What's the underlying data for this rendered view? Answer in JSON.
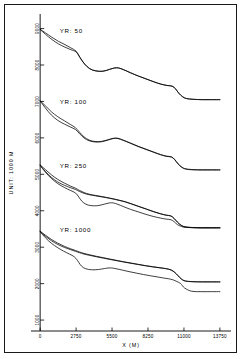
{
  "figure": {
    "background_color": "#ffffff",
    "frame_color": "#1a1a1a",
    "line_color": "#000000"
  },
  "chart_data": {
    "type": "line",
    "title": "",
    "subtitle": "",
    "xlabel": "X (M)",
    "ylabel": "UNIT: 1000 M",
    "xlim": [
      -700,
      14600
    ],
    "ylim": [
      700,
      9400
    ],
    "grid": false,
    "legend_position": "inline-annotation",
    "x_ticks": [
      0,
      2750,
      5500,
      8250,
      11000,
      13750
    ],
    "x_tick_labels": [
      "0",
      "2750",
      "5500",
      "8250",
      "11000",
      "13750"
    ],
    "y_ticks": [
      1000,
      2000,
      3000,
      4000,
      5000,
      6000,
      7000,
      8000,
      9000
    ],
    "y_tick_labels": [
      "1000",
      "2000",
      "3000",
      "4000",
      "5000",
      "6000",
      "7000",
      "8000",
      "9000"
    ],
    "annotations": [
      {
        "text": "YR:    50",
        "x": 1500,
        "y": 8870
      },
      {
        "text": "YR:   100",
        "x": 1500,
        "y": 6930
      },
      {
        "text": "YR:   250",
        "x": 1500,
        "y": 5180
      },
      {
        "text": "YR:  1000",
        "x": 1500,
        "y": 3420
      }
    ],
    "panels": [
      {
        "name": "YR: 50",
        "label": "YR:    50",
        "year": 50,
        "series": [
          {
            "name": "yr50-profile-a",
            "x": [
              0,
              420,
              900,
              1400,
              1900,
              2350,
              2750,
              3050,
              3400,
              3800,
              4250,
              4800,
              5300,
              5700,
              6000,
              6400,
              6900,
              7500,
              8100,
              8700,
              9200,
              9700,
              10100,
              10350,
              10600,
              10900,
              11200,
              11700,
              12400,
              13100,
              13750
            ],
            "y": [
              8980,
              8880,
              8760,
              8650,
              8560,
              8470,
              8380,
              8210,
              8030,
              7900,
              7840,
              7830,
              7880,
              7920,
              7920,
              7870,
              7790,
              7700,
              7620,
              7540,
              7480,
              7440,
              7420,
              7350,
              7230,
              7130,
              7080,
              7060,
              7050,
              7050,
              7050
            ]
          },
          {
            "name": "yr50-profile-b",
            "x": [
              0,
              420,
              900,
              1400,
              1900,
              2350,
              2750,
              3050,
              3400,
              3800,
              4250,
              4800,
              5300,
              5700,
              6000,
              6400,
              6900,
              7500,
              8100,
              8700,
              9200,
              9700,
              10100,
              10350,
              10600,
              10900,
              11200,
              11700,
              12400,
              13100,
              13750
            ],
            "y": [
              8975,
              8840,
              8700,
              8580,
              8490,
              8420,
              8360,
              8200,
              8025,
              7895,
              7838,
              7828,
              7878,
              7918,
              7918,
              7868,
              7788,
              7698,
              7618,
              7538,
              7478,
              7438,
              7418,
              7348,
              7228,
              7128,
              7078,
              7058,
              7048,
              7048,
              7048
            ]
          }
        ]
      },
      {
        "name": "YR: 100",
        "label": "YR:   100",
        "year": 100,
        "series": [
          {
            "name": "yr100-profile-a",
            "x": [
              0,
              400,
              850,
              1350,
              1850,
              2300,
              2700,
              3000,
              3350,
              3750,
              4200,
              4700,
              5200,
              5600,
              5950,
              6350,
              6900,
              7500,
              8100,
              8700,
              9200,
              9650,
              10050,
              10300,
              10550,
              10850,
              11150,
              11700,
              12400,
              13100,
              13750
            ],
            "y": [
              7020,
              6880,
              6720,
              6580,
              6470,
              6370,
              6280,
              6160,
              6030,
              5940,
              5900,
              5905,
              5950,
              5990,
              5990,
              5940,
              5860,
              5770,
              5690,
              5610,
              5545,
              5500,
              5480,
              5405,
              5290,
              5195,
              5150,
              5130,
              5125,
              5125,
              5125
            ]
          },
          {
            "name": "yr100-profile-b",
            "x": [
              0,
              400,
              850,
              1350,
              1850,
              2300,
              2700,
              3000,
              3350,
              3750,
              4200,
              4700,
              5200,
              5600,
              5950,
              6350,
              6900,
              7500,
              8100,
              8700,
              9200,
              9650,
              10050,
              10300,
              10550,
              10850,
              11150,
              11700,
              12400,
              13100,
              13750
            ],
            "y": [
              7015,
              6820,
              6630,
              6480,
              6380,
              6300,
              6230,
              6120,
              6000,
              5920,
              5888,
              5893,
              5942,
              5982,
              5982,
              5932,
              5852,
              5762,
              5682,
              5602,
              5538,
              5493,
              5473,
              5398,
              5283,
              5188,
              5143,
              5123,
              5118,
              5118,
              5118
            ]
          }
        ]
      },
      {
        "name": "YR: 250",
        "label": "YR:   250",
        "year": 250,
        "series": [
          {
            "name": "yr250-profile-a",
            "x": [
              0,
              400,
              850,
              1350,
              1850,
              2300,
              2700,
              3000,
              3350,
              3750,
              4250,
              4800,
              5300,
              5700,
              6050,
              6500,
              7000,
              7550,
              8150,
              8700,
              9200,
              9650,
              10000,
              10250,
              10500,
              10800,
              11100,
              11700,
              12400,
              13100,
              13750
            ],
            "y": [
              5260,
              5130,
              4990,
              4860,
              4760,
              4680,
              4620,
              4560,
              4500,
              4455,
              4420,
              4385,
              4350,
              4320,
              4290,
              4250,
              4190,
              4120,
              4045,
              3975,
              3920,
              3880,
              3860,
              3790,
              3690,
              3600,
              3560,
              3540,
              3535,
              3535,
              3535
            ]
          },
          {
            "name": "yr250-profile-b",
            "x": [
              0,
              400,
              850,
              1350,
              1850,
              2300,
              2700,
              3000,
              3350,
              3750,
              4250,
              4800,
              5300,
              5700,
              6050,
              6500,
              7000,
              7550,
              8150,
              8700,
              9200,
              9650,
              10000,
              10250,
              10500,
              10800,
              11100,
              11700,
              12400,
              13100,
              13750
            ],
            "y": [
              5250,
              5080,
              4920,
              4790,
              4700,
              4635,
              4585,
              4530,
              4478,
              4440,
              4408,
              4375,
              4342,
              4312,
              4283,
              4243,
              4184,
              4114,
              4040,
              3970,
              3916,
              3876,
              3856,
              3786,
              3686,
              3596,
              3556,
              3536,
              3531,
              3531,
              3531
            ]
          },
          {
            "name": "yr250-profile-c",
            "x": [
              0,
              400,
              850,
              1350,
              1850,
              2300,
              2700,
              2950,
              3200,
              3500,
              3900,
              4400,
              4900,
              5300,
              5600,
              5950,
              6400,
              6900,
              7500,
              8100,
              8700,
              9200,
              9650,
              10000,
              10250,
              10500,
              10800,
              11100,
              11700,
              12400,
              13100,
              13750
            ],
            "y": [
              5245,
              5060,
              4890,
              4745,
              4640,
              4560,
              4490,
              4380,
              4260,
              4180,
              4140,
              4140,
              4180,
              4215,
              4215,
              4175,
              4110,
              4040,
              3970,
              3900,
              3840,
              3800,
              3770,
              3755,
              3700,
              3620,
              3570,
              3545,
              3535,
              3530,
              3530,
              3530
            ]
          }
        ]
      },
      {
        "name": "YR: 1000",
        "label": "YR:  1000",
        "year": 1000,
        "series": [
          {
            "name": "yr1000-profile-a",
            "x": [
              0,
              400,
              850,
              1350,
              1850,
              2300,
              2700,
              3000,
              3350,
              3800,
              4300,
              4850,
              5400,
              5900,
              6400,
              6950,
              7500,
              8050,
              8600,
              9100,
              9500,
              9800,
              10050,
              10300,
              10550,
              10800,
              11100,
              11700,
              12400,
              13100,
              13750
            ],
            "y": [
              3440,
              3330,
              3215,
              3110,
              3025,
              2960,
              2910,
              2870,
              2830,
              2790,
              2750,
              2710,
              2670,
              2635,
              2600,
              2565,
              2530,
              2495,
              2465,
              2440,
              2420,
              2400,
              2370,
              2310,
              2220,
              2130,
              2075,
              2055,
              2050,
              2050,
              2050
            ]
          },
          {
            "name": "yr1000-profile-b",
            "x": [
              0,
              400,
              850,
              1350,
              1850,
              2300,
              2700,
              3000,
              3350,
              3800,
              4300,
              4850,
              5400,
              5900,
              6400,
              6950,
              7500,
              8050,
              8600,
              9100,
              9500,
              9800,
              10050,
              10300,
              10550,
              10800,
              11100,
              11700,
              12400,
              13100,
              13750
            ],
            "y": [
              3432,
              3300,
              3180,
              3075,
              2995,
              2935,
              2888,
              2850,
              2812,
              2775,
              2737,
              2698,
              2660,
              2626,
              2592,
              2558,
              2524,
              2490,
              2460,
              2436,
              2416,
              2396,
              2366,
              2306,
              2216,
              2126,
              2071,
              2051,
              2046,
              2046,
              2046
            ]
          },
          {
            "name": "yr1000-profile-c",
            "x": [
              0,
              400,
              850,
              1350,
              1800,
              2250,
              2600,
              2850,
              3050,
              3300,
              3700,
              4200,
              4700,
              5100,
              5450,
              5800,
              6300,
              6800,
              7350,
              7900,
              8450,
              8950,
              9350,
              9700,
              9950,
              10200,
              10450,
              10750,
              11050,
              11600,
              12300,
              13100,
              13750
            ],
            "y": [
              3425,
              3260,
              3110,
              2985,
              2890,
              2810,
              2740,
              2640,
              2530,
              2440,
              2390,
              2380,
              2400,
              2425,
              2430,
              2410,
              2370,
              2330,
              2290,
              2250,
              2215,
              2185,
              2160,
              2140,
              2125,
              2100,
              2060,
              2000,
              1880,
              1790,
              1780,
              1780,
              1780
            ]
          }
        ]
      }
    ]
  }
}
